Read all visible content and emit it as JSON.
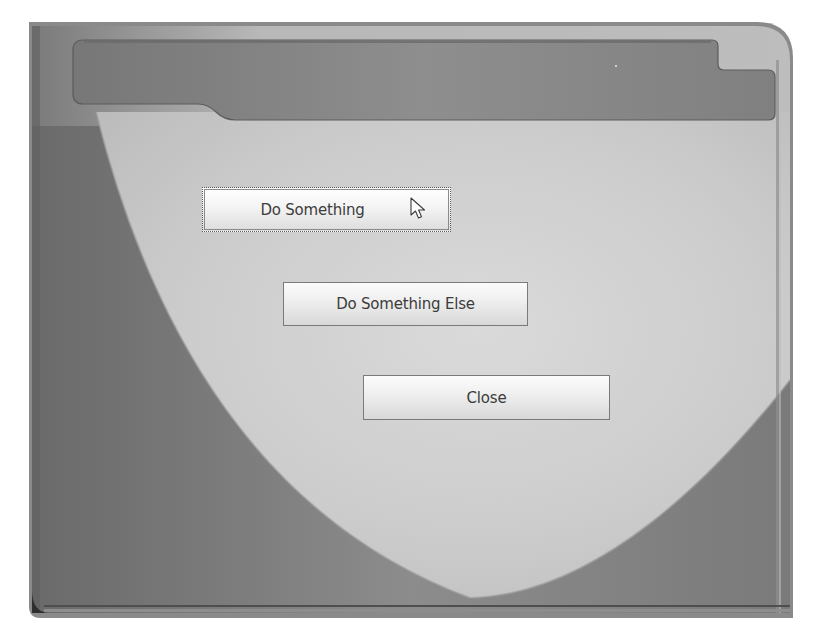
{
  "window": {
    "title_bar_text": "",
    "colors": {
      "frame_dark": "#6e6e6e",
      "frame_mid": "#8a8a8a",
      "title_bar": "#7f7f7f",
      "panel_light": "#cfcfcf",
      "button_text": "#3c3c3c",
      "button_border": "#7a7a7a"
    }
  },
  "buttons": [
    {
      "label": "Do Something",
      "state": "hovered"
    },
    {
      "label": "Do Something Else",
      "state": "normal"
    },
    {
      "label": "Close",
      "state": "normal"
    }
  ],
  "cursor": {
    "icon": "arrow-pointer-icon",
    "x": 412,
    "y": 200
  }
}
